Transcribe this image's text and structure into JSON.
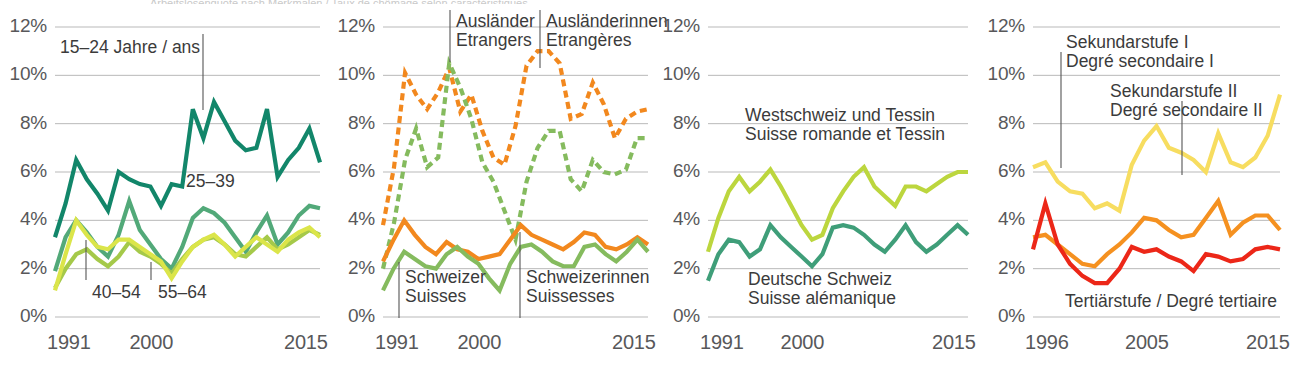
{
  "figure": {
    "top_title_clipped": "Arbeitslosenquote nach Merkmalen / Taux de chômage selon caractéristiques",
    "panel_count": 4
  },
  "axis": {
    "yticks": [
      "12%",
      "10%",
      "8%",
      "6%",
      "4%",
      "2%",
      "0%"
    ],
    "ytick_values": [
      12,
      10,
      8,
      6,
      4,
      2,
      0
    ],
    "xticks_a": [
      "1991",
      "2000",
      "2015"
    ],
    "xticks_b": [
      "1996",
      "2005",
      "2015"
    ]
  },
  "colors": {
    "dark_teal": "#12866a",
    "mid_green": "#52a979",
    "light_green": "#a5c94a",
    "pale_yellow_green": "#dbe54a",
    "dashed_green": "#85bb5e",
    "dashed_orange": "#f2881e",
    "solid_orange": "#f2881e",
    "solid_green": "#85bb5e",
    "olive_green": "#bcd63e",
    "teal_green": "#3f9e79",
    "yellow": "#f7dd60",
    "orange": "#f59120",
    "red": "#ec2718",
    "gridline": "#b9b9b9",
    "text": "#58585a"
  },
  "panels": [
    {
      "id": "panel-1",
      "name": "age-groups",
      "xticks": [
        "1991",
        "2000",
        "2015"
      ],
      "annotations": [
        {
          "name": "label-15-24",
          "lines": [
            "15–24 Jahre / ans"
          ]
        },
        {
          "name": "label-25-39",
          "lines": [
            "25–39"
          ]
        },
        {
          "name": "label-40-54",
          "lines": [
            "40–54"
          ]
        },
        {
          "name": "label-55-64",
          "lines": [
            "55–64"
          ]
        }
      ]
    },
    {
      "id": "panel-2",
      "name": "nationality-sex",
      "xticks": [
        "1991",
        "2000",
        "2015"
      ],
      "annotations": [
        {
          "name": "label-auslaender",
          "lines": [
            "Ausländer",
            "Etrangers"
          ]
        },
        {
          "name": "label-auslaenderinnen",
          "lines": [
            "Ausländerinnen",
            "Etrangères"
          ]
        },
        {
          "name": "label-schweizer",
          "lines": [
            "Schweizer",
            "Suisses"
          ]
        },
        {
          "name": "label-schweizerinnen",
          "lines": [
            "Schweizerinnen",
            "Suissesses"
          ]
        }
      ]
    },
    {
      "id": "panel-3",
      "name": "language-regions",
      "xticks": [
        "1991",
        "2000",
        "2015"
      ],
      "annotations": [
        {
          "name": "label-westschweiz",
          "lines": [
            "Westschweiz und Tessin",
            "Suisse romande et Tessin"
          ]
        },
        {
          "name": "label-deutsche-schweiz",
          "lines": [
            "Deutsche Schweiz",
            "Suisse alémanique"
          ]
        }
      ]
    },
    {
      "id": "panel-4",
      "name": "education-levels",
      "xticks": [
        "1996",
        "2005",
        "2015"
      ],
      "annotations": [
        {
          "name": "label-sekundarstufe-1",
          "lines": [
            "Sekundarstufe I",
            "Degré secondaire I"
          ]
        },
        {
          "name": "label-sekundarstufe-2",
          "lines": [
            "Sekundarstufe II",
            "Degré secondaire II"
          ]
        },
        {
          "name": "label-tertiaerstufe",
          "lines": [
            "Tertiärstufe / Degré tertiaire"
          ]
        }
      ]
    }
  ],
  "chart_data": [
    {
      "type": "line",
      "panel": "panel-1",
      "title": "Arbeitslosenquote nach Altersgruppe / Taux de chômage selon groupe d'âge",
      "xlabel": "",
      "ylabel": "%",
      "xlim": [
        1991,
        2015
      ],
      "ylim": [
        0,
        12
      ],
      "grid": true,
      "legend": "inline-annotations",
      "x": [
        1991,
        1992,
        1993,
        1994,
        1995,
        1996,
        1997,
        1998,
        1999,
        2000,
        2001,
        2002,
        2003,
        2004,
        2005,
        2006,
        2007,
        2008,
        2009,
        2010,
        2011,
        2012,
        2013,
        2014,
        2015
      ],
      "series": [
        {
          "name": "15–24 Jahre / ans",
          "color": "#12866a",
          "values": [
            3.3,
            4.7,
            6.5,
            5.7,
            5.1,
            4.4,
            6.0,
            5.7,
            5.5,
            5.4,
            4.6,
            5.5,
            5.4,
            8.6,
            7.4,
            8.9,
            8.1,
            7.3,
            6.9,
            7.0,
            8.6,
            5.8,
            6.5,
            7.0,
            7.8,
            6.4
          ]
        },
        {
          "name": "25–39",
          "color": "#52a979",
          "values": [
            1.9,
            3.3,
            4.0,
            3.5,
            2.9,
            2.5,
            3.4,
            4.8,
            3.6,
            3.0,
            2.4,
            2.0,
            2.9,
            4.1,
            4.5,
            4.3,
            3.9,
            3.3,
            2.7,
            3.5,
            4.2,
            3.0,
            3.5,
            4.2,
            4.6,
            4.5
          ]
        },
        {
          "name": "40–54",
          "color": "#a5c94a",
          "values": [
            1.2,
            2.0,
            2.6,
            2.8,
            2.4,
            2.1,
            2.5,
            3.1,
            2.7,
            2.5,
            2.2,
            1.8,
            2.4,
            2.9,
            3.2,
            3.3,
            3.0,
            2.6,
            2.5,
            2.9,
            3.3,
            2.8,
            3.0,
            3.3,
            3.6,
            3.4
          ]
        },
        {
          "name": "55–64",
          "color": "#dbe54a",
          "values": [
            1.1,
            2.6,
            4.0,
            3.4,
            2.9,
            2.8,
            3.2,
            3.2,
            2.9,
            2.6,
            2.3,
            1.6,
            2.3,
            2.9,
            3.2,
            3.4,
            3.0,
            2.5,
            2.9,
            3.3,
            3.0,
            2.7,
            3.2,
            3.5,
            3.7,
            3.3
          ]
        }
      ]
    },
    {
      "type": "line",
      "panel": "panel-2",
      "title": "Arbeitslosenquote nach Nationalität und Geschlecht / Taux de chômage selon nationalité et sexe",
      "xlabel": "",
      "ylabel": "%",
      "xlim": [
        1991,
        2015
      ],
      "ylim": [
        0,
        12
      ],
      "grid": true,
      "x": [
        1991,
        1992,
        1993,
        1994,
        1995,
        1996,
        1997,
        1998,
        1999,
        2000,
        2001,
        2002,
        2003,
        2004,
        2005,
        2006,
        2007,
        2008,
        2009,
        2010,
        2011,
        2012,
        2013,
        2014,
        2015
      ],
      "series": [
        {
          "name": "Ausländer / Etrangers",
          "color": "#f2881e",
          "style": "dashed",
          "values": [
            3.8,
            6.2,
            10.1,
            9.2,
            8.6,
            9.3,
            10.3,
            8.5,
            9.2,
            7.7,
            6.6,
            6.3,
            7.9,
            10.4,
            11.0,
            11.0,
            10.5,
            8.2,
            8.4,
            9.7,
            8.8,
            7.4,
            8.2,
            8.5,
            8.6
          ]
        },
        {
          "name": "Ausländerinnen / Etrangères",
          "color": "#85bb5e",
          "style": "dashed",
          "values": [
            2.0,
            3.9,
            6.5,
            7.8,
            6.2,
            6.6,
            10.5,
            9.5,
            8.2,
            6.4,
            5.6,
            4.4,
            3.2,
            5.6,
            7.0,
            7.7,
            7.7,
            5.7,
            5.2,
            6.5,
            6.0,
            5.9,
            6.1,
            7.4,
            7.4
          ]
        },
        {
          "name": "Schweizer / Suisses",
          "color": "#f2881e",
          "style": "solid",
          "values": [
            2.3,
            3.2,
            4.0,
            3.4,
            2.9,
            2.6,
            3.1,
            2.8,
            2.7,
            2.4,
            2.5,
            2.6,
            3.2,
            3.8,
            3.4,
            3.2,
            3.0,
            2.8,
            3.1,
            3.5,
            3.4,
            2.9,
            2.8,
            3.0,
            3.3,
            3.0
          ]
        },
        {
          "name": "Schweizerinnen / Suissesses",
          "color": "#85bb5e",
          "style": "solid",
          "values": [
            1.1,
            2.0,
            2.7,
            2.4,
            2.1,
            2.0,
            2.6,
            2.9,
            2.5,
            2.2,
            1.6,
            1.1,
            2.2,
            2.9,
            3.0,
            2.7,
            2.3,
            2.1,
            2.1,
            2.9,
            3.0,
            2.6,
            2.3,
            2.7,
            3.2,
            2.7
          ]
        }
      ]
    },
    {
      "type": "line",
      "panel": "panel-3",
      "title": "Arbeitslosenquote nach Sprachregion / Taux de chômage selon région linguistique",
      "xlabel": "",
      "ylabel": "%",
      "xlim": [
        1991,
        2015
      ],
      "ylim": [
        0,
        12
      ],
      "grid": true,
      "x": [
        1991,
        1992,
        1993,
        1994,
        1995,
        1996,
        1997,
        1998,
        1999,
        2000,
        2001,
        2002,
        2003,
        2004,
        2005,
        2006,
        2007,
        2008,
        2009,
        2010,
        2011,
        2012,
        2013,
        2014,
        2015
      ],
      "series": [
        {
          "name": "Westschweiz und Tessin / Suisse romande et Tessin",
          "color": "#bcd63e",
          "values": [
            2.7,
            4.1,
            5.2,
            5.8,
            5.2,
            5.6,
            6.1,
            5.4,
            4.6,
            3.8,
            3.2,
            3.4,
            4.5,
            5.2,
            5.8,
            6.2,
            5.4,
            5.0,
            4.6,
            5.4,
            5.4,
            5.2,
            5.5,
            5.8,
            6.0,
            6.0
          ]
        },
        {
          "name": "Deutsche Schweiz / Suisse alémanique",
          "color": "#3f9e79",
          "values": [
            1.5,
            2.6,
            3.2,
            3.1,
            2.5,
            2.8,
            3.8,
            3.3,
            2.9,
            2.5,
            2.1,
            2.6,
            3.7,
            3.8,
            3.7,
            3.4,
            3.0,
            2.7,
            3.2,
            3.8,
            3.1,
            2.7,
            3.0,
            3.4,
            3.8,
            3.4
          ]
        }
      ]
    },
    {
      "type": "line",
      "panel": "panel-4",
      "title": "Arbeitslosenquote nach Bildungsstand / Taux de chômage selon niveau de formation",
      "xlabel": "",
      "ylabel": "%",
      "xlim": [
        1996,
        2015
      ],
      "ylim": [
        0,
        12
      ],
      "grid": true,
      "x": [
        1996,
        1997,
        1998,
        1999,
        2000,
        2001,
        2002,
        2003,
        2004,
        2005,
        2006,
        2007,
        2008,
        2009,
        2010,
        2011,
        2012,
        2013,
        2014,
        2015
      ],
      "series": [
        {
          "name": "Sekundarstufe I / Degré secondaire I",
          "color": "#f7dd60",
          "values": [
            6.2,
            6.4,
            5.6,
            5.2,
            5.1,
            4.5,
            4.7,
            4.4,
            6.3,
            7.3,
            7.9,
            7.0,
            6.8,
            6.5,
            6.0,
            7.6,
            6.4,
            6.2,
            6.6,
            7.5,
            9.2
          ]
        },
        {
          "name": "Sekundarstufe II / Degré secondaire II",
          "color": "#f59120",
          "values": [
            3.3,
            3.4,
            3.0,
            2.6,
            2.2,
            2.1,
            2.6,
            3.0,
            3.5,
            4.1,
            4.0,
            3.6,
            3.3,
            3.4,
            4.1,
            4.8,
            3.4,
            3.9,
            4.2,
            4.2,
            3.6
          ]
        },
        {
          "name": "Tertiärstufe / Degré tertiaire",
          "color": "#ec2718",
          "values": [
            2.8,
            4.7,
            3.0,
            2.2,
            1.7,
            1.4,
            1.4,
            2.0,
            2.9,
            2.7,
            2.8,
            2.5,
            2.3,
            1.9,
            2.6,
            2.5,
            2.3,
            2.4,
            2.8,
            2.9,
            2.8
          ]
        }
      ]
    }
  ]
}
